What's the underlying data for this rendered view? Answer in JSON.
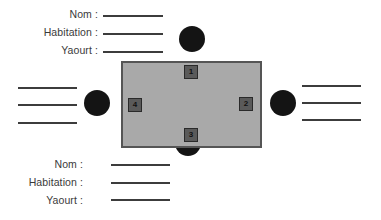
{
  "top_form": {
    "fields": [
      {
        "label": "Nom :"
      },
      {
        "label": "Habitation :"
      },
      {
        "label": "Yaourt :"
      }
    ]
  },
  "bottom_form": {
    "fields": [
      {
        "label": "Nom :"
      },
      {
        "label": "Habitation :"
      },
      {
        "label": "Yaourt :"
      }
    ]
  },
  "table": {
    "seats": [
      {
        "number": "1",
        "position": "top"
      },
      {
        "number": "2",
        "position": "right"
      },
      {
        "number": "3",
        "position": "bottom"
      },
      {
        "number": "4",
        "position": "left"
      }
    ]
  },
  "people": [
    "top",
    "right",
    "bottom",
    "left"
  ],
  "colors": {
    "table": "#a9a9a9",
    "seat": "#5a5a5a",
    "person": "#141414",
    "line": "#3c3c3c"
  }
}
